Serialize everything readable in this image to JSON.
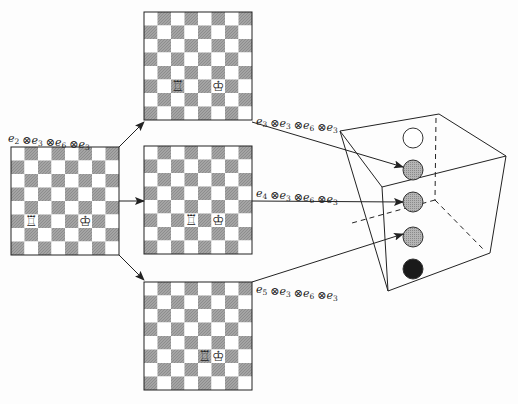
{
  "diagram": {
    "boards": [
      {
        "id": "source",
        "x": 11,
        "y": 147,
        "size": 108,
        "pieces": [
          {
            "type": "rook",
            "glyph": "♖",
            "col": 1,
            "row": 5
          },
          {
            "type": "king",
            "glyph": "♔",
            "col": 5,
            "row": 5
          }
        ],
        "label": {
          "text": "e2 ⊗ e3 ⊗ e6 ⊗ e3",
          "terms": [
            {
              "b": "e",
              "s": "2"
            },
            {
              "b": "e",
              "s": "3"
            },
            {
              "b": "e",
              "s": "6"
            },
            {
              "b": "e",
              "s": "3"
            }
          ],
          "x": 8,
          "y": 142
        }
      },
      {
        "id": "top",
        "x": 144,
        "y": 12,
        "size": 108,
        "pieces": [
          {
            "type": "rook",
            "glyph": "♖",
            "col": 2,
            "row": 5
          },
          {
            "type": "king",
            "glyph": "♔",
            "col": 5,
            "row": 5
          }
        ],
        "label": {
          "text": "e3 ⊗ e3 ⊗ e6 ⊗ e3",
          "terms": [
            {
              "b": "e",
              "s": "3"
            },
            {
              "b": "e",
              "s": "3"
            },
            {
              "b": "e",
              "s": "6"
            },
            {
              "b": "e",
              "s": "3"
            }
          ],
          "x": 256,
          "y": 125
        }
      },
      {
        "id": "middle",
        "x": 144,
        "y": 146,
        "size": 108,
        "pieces": [
          {
            "type": "rook",
            "glyph": "♖",
            "col": 3,
            "row": 5
          },
          {
            "type": "king",
            "glyph": "♔",
            "col": 5,
            "row": 5
          }
        ],
        "label": {
          "text": "e4 ⊗ e3 ⊗ e6 ⊗ e3",
          "terms": [
            {
              "b": "e",
              "s": "4"
            },
            {
              "b": "e",
              "s": "3"
            },
            {
              "b": "e",
              "s": "6"
            },
            {
              "b": "e",
              "s": "3"
            }
          ],
          "x": 256,
          "y": 197
        }
      },
      {
        "id": "bottom",
        "x": 144,
        "y": 282,
        "size": 108,
        "pieces": [
          {
            "type": "rook",
            "glyph": "♖",
            "col": 4,
            "row": 5
          },
          {
            "type": "king",
            "glyph": "♔",
            "col": 5,
            "row": 5
          }
        ],
        "label": {
          "text": "e5 ⊗ e3 ⊗ e6 ⊗ e3",
          "terms": [
            {
              "b": "e",
              "s": "5"
            },
            {
              "b": "e",
              "s": "3"
            },
            {
              "b": "e",
              "s": "6"
            },
            {
              "b": "e",
              "s": "3"
            }
          ],
          "x": 256,
          "y": 293
        }
      }
    ],
    "cube": {
      "solid_edges": [
        [
          340,
          131,
          439,
          114
        ],
        [
          439,
          114,
          506,
          156
        ],
        [
          506,
          156,
          382,
          187
        ],
        [
          382,
          187,
          340,
          131
        ],
        [
          340,
          131,
          388,
          291
        ],
        [
          382,
          187,
          388,
          291
        ],
        [
          506,
          156,
          490,
          253
        ],
        [
          490,
          253,
          388,
          291
        ]
      ],
      "dashed_edges": [
        [
          436,
          118,
          435,
          200
        ],
        [
          435,
          200,
          352,
          223
        ],
        [
          435,
          200,
          484,
          250
        ]
      ],
      "circles": [
        {
          "cx": 413,
          "cy": 138,
          "r": 10,
          "fill": "#ffffff",
          "name": "white-state"
        },
        {
          "cx": 413,
          "cy": 170,
          "r": 10,
          "fill": "#a9a9a9",
          "name": "gray-state-1"
        },
        {
          "cx": 413,
          "cy": 202,
          "r": 10,
          "fill": "#a9a9a9",
          "name": "gray-state-2"
        },
        {
          "cx": 413,
          "cy": 237,
          "r": 10,
          "fill": "#a9a9a9",
          "name": "gray-state-3"
        },
        {
          "cx": 413,
          "cy": 269,
          "r": 10,
          "fill": "#1a1a1a",
          "name": "black-state"
        }
      ]
    },
    "arrows": [
      {
        "from": [
          119,
          147
        ],
        "to": [
          144,
          122
        ],
        "name": "arrow-to-top"
      },
      {
        "from": [
          119,
          201
        ],
        "to": [
          144,
          201
        ],
        "name": "arrow-to-middle"
      },
      {
        "from": [
          119,
          255
        ],
        "to": [
          144,
          280
        ],
        "name": "arrow-to-bottom"
      },
      {
        "from": [
          252,
          122
        ],
        "to": [
          403,
          167
        ],
        "name": "arrow-top-to-cube"
      },
      {
        "from": [
          252,
          201
        ],
        "to": [
          403,
          202
        ],
        "name": "arrow-middle-to-cube"
      },
      {
        "from": [
          252,
          282
        ],
        "to": [
          403,
          234
        ],
        "name": "arrow-bottom-to-cube"
      }
    ],
    "colors": {
      "dark_square": "#9a9a9a",
      "light_square": "#ffffff",
      "line": "#222222"
    }
  }
}
